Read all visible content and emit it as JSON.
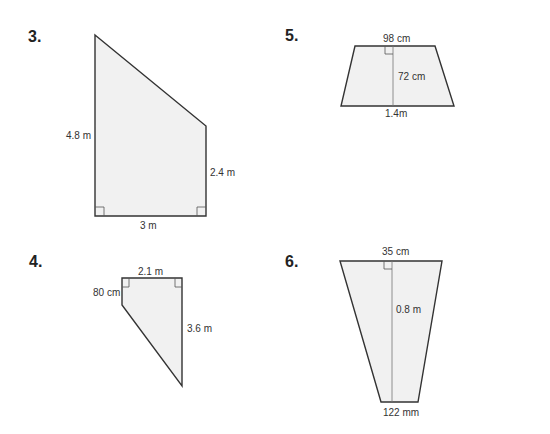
{
  "problems": [
    {
      "number": "3.",
      "shape": "right trapezoid",
      "labels": {
        "left": "4.8 m",
        "right": "2.4 m",
        "bottom": "3 m"
      }
    },
    {
      "number": "4.",
      "shape": "right trapezoid",
      "labels": {
        "top": "2.1 m",
        "left": "80 cm",
        "right": "3.6 m"
      }
    },
    {
      "number": "5.",
      "shape": "trapezoid",
      "labels": {
        "top": "98 cm",
        "height": "72 cm",
        "bottom": "1.4m"
      }
    },
    {
      "number": "6.",
      "shape": "trapezoid",
      "labels": {
        "top": "35 cm",
        "height": "0.8 m",
        "bottom": "122 mm"
      }
    }
  ],
  "colors": {
    "fill": "#f1f1f1",
    "stroke": "#333333"
  }
}
